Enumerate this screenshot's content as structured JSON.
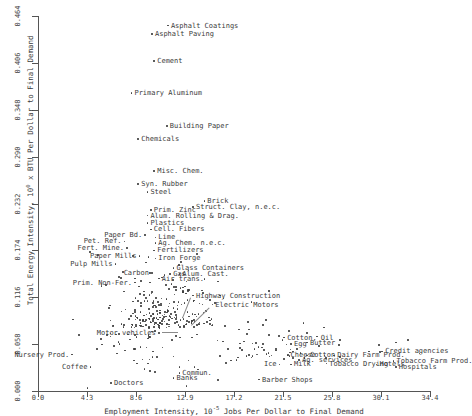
{
  "chart_data": {
    "type": "scatter",
    "title": "",
    "xlabel": "Employment Intensity, 10^-5 Jobs Per Dollar to Final Demand",
    "xlabel_prefix": "Employment Intensity, 10",
    "xlabel_exp": "-5",
    "xlabel_suffix": " Jobs Per Dollar to Final Demand",
    "ylabel": "Total Energy Intensity, 10^0 x BTU Per Dollar to Final Demand",
    "ylabel_prefix": "Total Energy Intensity, 10",
    "ylabel_exp": "0",
    "ylabel_suffix": " x BTU Per Dollar to Final Demand",
    "xlim": [
      0.0,
      34.4
    ],
    "ylim": [
      0.0,
      0.464
    ],
    "xticks": [
      "0.0",
      "4.3",
      "8.6",
      "12.9",
      "17.2",
      "21.5",
      "25.8",
      "30.1",
      "34.4"
    ],
    "yticks": [
      "0.464",
      "0.406",
      "0.348",
      "0.290",
      "0.232",
      "0.174",
      "0.116",
      "0.058",
      "0.000"
    ],
    "grid": false,
    "legend": "none",
    "marker_color": "#3c3c3c",
    "axis_color": "#555555",
    "labeled_points": [
      {
        "label": "Asphalt Coatings",
        "x": 11.4,
        "y": 0.452,
        "side": "right"
      },
      {
        "label": "Asphalt Paving",
        "x": 10.0,
        "y": 0.442,
        "side": "right"
      },
      {
        "label": "Cement",
        "x": 10.2,
        "y": 0.408,
        "side": "right"
      },
      {
        "label": "Primary Aluminum",
        "x": 8.2,
        "y": 0.369,
        "side": "right"
      },
      {
        "label": "Building Paper",
        "x": 11.3,
        "y": 0.328,
        "side": "right"
      },
      {
        "label": "Chemicals",
        "x": 8.8,
        "y": 0.312,
        "side": "right"
      },
      {
        "label": "Misc. Chem.",
        "x": 10.2,
        "y": 0.272,
        "side": "right"
      },
      {
        "label": "Syn. Rubber",
        "x": 8.8,
        "y": 0.256,
        "side": "right"
      },
      {
        "label": "Steel",
        "x": 9.6,
        "y": 0.246,
        "side": "right"
      },
      {
        "label": "Brick",
        "x": 14.6,
        "y": 0.235,
        "side": "right"
      },
      {
        "label": "Struct. Clay, n.e.c.",
        "x": 13.6,
        "y": 0.228,
        "side": "right"
      },
      {
        "label": "Prim. Zinc",
        "x": 9.9,
        "y": 0.224,
        "side": "right"
      },
      {
        "label": "Alum. Rolling & Drag.",
        "x": 9.6,
        "y": 0.217,
        "side": "right"
      },
      {
        "label": "Plastics",
        "x": 9.6,
        "y": 0.208,
        "side": "right"
      },
      {
        "label": "Cell. Fibers",
        "x": 9.9,
        "y": 0.2,
        "side": "right"
      },
      {
        "label": "Paper Bd.",
        "x": 9.4,
        "y": 0.193,
        "side": "left"
      },
      {
        "label": "Lime",
        "x": 10.3,
        "y": 0.19,
        "side": "right"
      },
      {
        "label": "Pet. Ref.",
        "x": 7.6,
        "y": 0.185,
        "side": "left"
      },
      {
        "label": "Ag. Chem. n.e.c.",
        "x": 10.3,
        "y": 0.183,
        "side": "right"
      },
      {
        "label": "Fert. Mine.",
        "x": 7.8,
        "y": 0.177,
        "side": "left"
      },
      {
        "label": "Fertilizers",
        "x": 10.2,
        "y": 0.174,
        "side": "right"
      },
      {
        "label": "Paper Mills",
        "x": 8.9,
        "y": 0.167,
        "side": "left"
      },
      {
        "label": "Iron Forge",
        "x": 10.3,
        "y": 0.164,
        "side": "right"
      },
      {
        "label": "Pulp Mills",
        "x": 6.8,
        "y": 0.157,
        "side": "left"
      },
      {
        "label": "Glass Containers",
        "x": 11.9,
        "y": 0.152,
        "side": "right"
      },
      {
        "label": "Carbon",
        "x": 10.0,
        "y": 0.146,
        "side": "left"
      },
      {
        "label": "Gas",
        "x": 11.6,
        "y": 0.145,
        "side": "right"
      },
      {
        "label": "Alum. Cast.",
        "x": 12.4,
        "y": 0.145,
        "side": "right"
      },
      {
        "label": "Air trans.",
        "x": 10.6,
        "y": 0.139,
        "side": "right"
      },
      {
        "label": "Prim. Non-Fer.",
        "x": 8.5,
        "y": 0.134,
        "side": "left"
      },
      {
        "label": "Highway Construction",
        "x": 13.6,
        "y": 0.118,
        "side": "right"
      },
      {
        "label": "Electric Motors",
        "x": 15.3,
        "y": 0.107,
        "side": "right"
      },
      {
        "label": "Motor vehicles",
        "x": 10.6,
        "y": 0.072,
        "side": "left"
      },
      {
        "label": "Cotton, Oil",
        "x": 21.6,
        "y": 0.066,
        "side": "right"
      },
      {
        "label": "Butter",
        "x": 23.6,
        "y": 0.06,
        "side": "right"
      },
      {
        "label": "Egg",
        "x": 22.2,
        "y": 0.058,
        "side": "right"
      },
      {
        "label": "Nursery Prod.",
        "x": 3.0,
        "y": 0.045,
        "side": "left"
      },
      {
        "label": "Cheese",
        "x": 21.9,
        "y": 0.044,
        "side": "right"
      },
      {
        "label": "Cotton",
        "x": 23.6,
        "y": 0.044,
        "side": "right"
      },
      {
        "label": "Dairy Farm Prod.",
        "x": 26.0,
        "y": 0.044,
        "side": "right"
      },
      {
        "label": "Credit agencies",
        "x": 30.2,
        "y": 0.049,
        "side": "right"
      },
      {
        "label": "Ag. services",
        "x": 22.9,
        "y": 0.038,
        "side": "right"
      },
      {
        "label": "Tobacco Drying",
        "x": 25.3,
        "y": 0.034,
        "side": "right"
      },
      {
        "label": "Tobacco Farm Prod.",
        "x": 31.2,
        "y": 0.037,
        "side": "right"
      },
      {
        "label": "Hotels",
        "x": 29.7,
        "y": 0.033,
        "side": "right"
      },
      {
        "label": "Hospitals",
        "x": 31.4,
        "y": 0.03,
        "side": "right"
      },
      {
        "label": "Coffee",
        "x": 4.6,
        "y": 0.03,
        "side": "left"
      },
      {
        "label": "Ice",
        "x": 21.2,
        "y": 0.033,
        "side": "left"
      },
      {
        "label": "Milk",
        "x": 22.2,
        "y": 0.033,
        "side": "right"
      },
      {
        "label": "Commun.",
        "x": 12.4,
        "y": 0.022,
        "side": "right"
      },
      {
        "label": "Banks",
        "x": 11.9,
        "y": 0.016,
        "side": "right"
      },
      {
        "label": "Barber Shops",
        "x": 19.4,
        "y": 0.014,
        "side": "right"
      },
      {
        "label": "Doctors",
        "x": 6.4,
        "y": 0.01,
        "side": "right"
      }
    ],
    "point_count": 360
  }
}
